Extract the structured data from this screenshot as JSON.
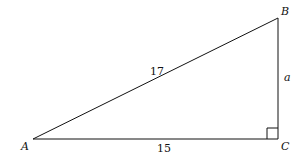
{
  "diagram": {
    "type": "right-triangle",
    "vertices": {
      "A": {
        "label": "A"
      },
      "B": {
        "label": "B"
      },
      "C": {
        "label": "C"
      }
    },
    "sides": {
      "hypotenuse_AB": {
        "label": "17"
      },
      "base_AC": {
        "label": "15"
      },
      "leg_BC": {
        "label": "a"
      }
    },
    "right_angle_at": "C",
    "stroke_color": "#111111"
  }
}
